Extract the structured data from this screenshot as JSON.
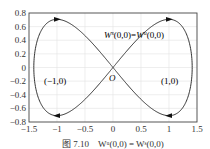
{
  "chart_data": {
    "type": "line",
    "title": "",
    "xlabel": "",
    "ylabel": "",
    "xlim": [
      -1.5,
      1.5
    ],
    "ylim": [
      -0.8,
      0.8
    ],
    "xticks": [
      -1.5,
      -1,
      -0.5,
      0,
      0.5,
      1,
      1.5
    ],
    "xtick_labels": [
      "-1.5",
      "-1",
      "-0.5",
      "0",
      "0.5",
      "1",
      "1.5"
    ],
    "yticks": [
      0.8,
      0.6,
      0.4,
      0.2,
      0,
      -0.2,
      -0.4,
      -0.6,
      -0.8
    ],
    "ytick_labels": [
      "0.8",
      "0.6",
      "0.4",
      "0.2",
      "0",
      "−0.2",
      "−0.4",
      "−0.6",
      "−0.8"
    ],
    "grid": true,
    "legend": null,
    "series": [
      {
        "name": "homoclinic orbit (figure-eight)",
        "equation": "y^2 = x^2 - x^4/2",
        "x": [
          -1.414,
          -1.3,
          -1.2,
          -1.0,
          -0.8,
          -0.6,
          -0.4,
          -0.2,
          0,
          0.2,
          0.4,
          0.6,
          0.8,
          1.0,
          1.2,
          1.3,
          1.414
        ],
        "y_upper": [
          0,
          0.51,
          0.63,
          0.707,
          0.69,
          0.55,
          0.38,
          0.2,
          0,
          0.2,
          0.38,
          0.55,
          0.69,
          0.707,
          0.63,
          0.51,
          0
        ],
        "y_lower": [
          0,
          -0.51,
          -0.63,
          -0.707,
          -0.69,
          -0.55,
          -0.38,
          -0.2,
          0,
          -0.2,
          -0.38,
          -0.55,
          -0.69,
          -0.707,
          -0.63,
          -0.51,
          0
        ]
      }
    ],
    "arrows": [
      {
        "x": -1,
        "y": 0.707,
        "direction": "right"
      },
      {
        "x": 1,
        "y": 0.707,
        "direction": "right"
      },
      {
        "x": -1,
        "y": -0.707,
        "direction": "left"
      },
      {
        "x": 1,
        "y": -0.707,
        "direction": "left"
      }
    ],
    "annotations": [
      {
        "text": "W^s(0,0)=W^u(0,0)",
        "x": -0.05,
        "y": 0.45
      },
      {
        "text": "O",
        "x": 0.02,
        "y": -0.08
      },
      {
        "text": "(-1,0)",
        "x": -1.1,
        "y": -0.1
      },
      {
        "text": "(1,0)",
        "x": 1.0,
        "y": -0.1
      }
    ]
  },
  "labels": {
    "manifold": "W",
    "sup_s": "s",
    "sup_u": "u",
    "arg": "(0,0)",
    "eq": "=",
    "origin": "O",
    "left_eq": "(−1,0)",
    "right_eq": "(1,0)"
  },
  "caption": "图 7.10　Wᵘ(0,0) = Wˢ(0,0)"
}
